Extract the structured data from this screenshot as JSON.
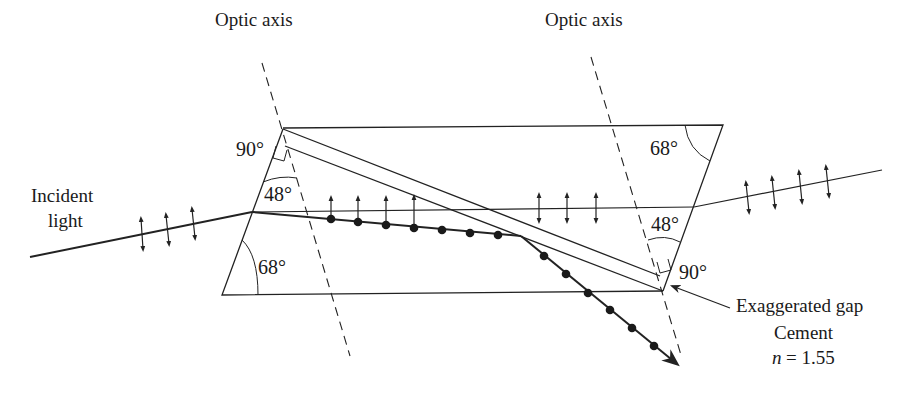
{
  "diagram": {
    "type": "optics",
    "labels": {
      "optic_axis_left": "Optic axis",
      "optic_axis_right": "Optic axis",
      "incident_line1": "Incident",
      "incident_line2": "light",
      "angle_tl_90": "90°",
      "angle_tl_48": "48°",
      "angle_bl_68": "68°",
      "angle_tr_68": "68°",
      "angle_br_48": "48°",
      "angle_br_90": "90°",
      "gap_label": "Exaggerated gap",
      "cement_label": "Cement",
      "n_symbol": "n",
      "n_value": "= 1.55"
    },
    "rays": {
      "incident": {
        "polarization": "mixed (arrows)",
        "arrow_count": 3
      },
      "e_ray_in_prism": {
        "polarization": "vertical arrows",
        "arrow_count_left": 4,
        "arrow_count_right": 3
      },
      "o_ray": {
        "polarization": "dots",
        "dot_count_before_gap": 7,
        "dot_count_after_gap": 6,
        "deflected": true
      },
      "transmitted": {
        "polarization": "vertical arrows",
        "arrow_count": 4
      }
    },
    "colors": {
      "line": "#222222",
      "background": "#ffffff"
    }
  }
}
